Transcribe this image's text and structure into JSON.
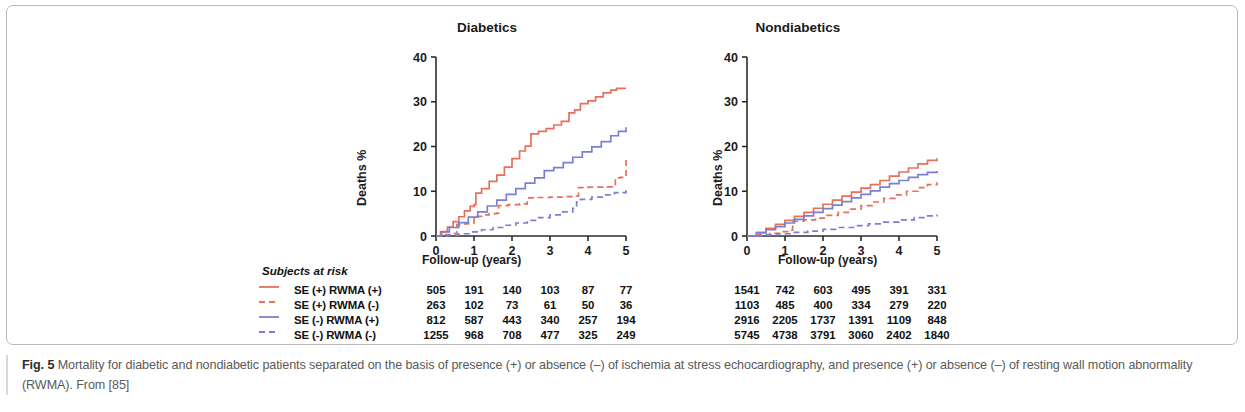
{
  "caption": {
    "label": "Fig. 5",
    "text": " Mortality for diabetic and nondiabetic patients separated on the basis of presence (+) or absence (–) of ischemia at stress echocardiography, and presence (+) or absence (–) of resting wall motion abnormality (RWMA). From [85]"
  },
  "colors": {
    "red": "#e8705a",
    "blue": "#7b7fd4",
    "axis": "#2b2b2b",
    "frame": "#b9b9b9"
  },
  "risk_table": {
    "header": "Subjects at risk",
    "row_labels": [
      "SE (+) RWMA (+)",
      "SE (+) RWMA (-)",
      "SE (-)  RWMA (+)",
      "SE (-)  RWMA (-)"
    ],
    "diabetics": [
      [
        "505",
        "191",
        "140",
        "103",
        "87",
        "77"
      ],
      [
        "263",
        "102",
        "73",
        "61",
        "50",
        "36"
      ],
      [
        "812",
        "587",
        "443",
        "340",
        "257",
        "194"
      ],
      [
        "1255",
        "968",
        "708",
        "477",
        "325",
        "249"
      ]
    ],
    "nondiabetics": [
      [
        "1541",
        "742",
        "603",
        "495",
        "391",
        "331"
      ],
      [
        "1103",
        "485",
        "400",
        "334",
        "279",
        "220"
      ],
      [
        "2916",
        "2205",
        "1737",
        "1391",
        "1109",
        "848"
      ],
      [
        "5745",
        "4738",
        "3791",
        "3060",
        "2402",
        "1840"
      ]
    ]
  },
  "chart_data": [
    {
      "type": "line",
      "title": "Diabetics",
      "xlabel": "Follow-up (years)",
      "ylabel": "Deaths %",
      "xlim": [
        0,
        5
      ],
      "ylim": [
        0,
        40
      ],
      "xticks": [
        0,
        1,
        2,
        3,
        4,
        5
      ],
      "yticks": [
        0,
        10,
        20,
        30,
        40
      ],
      "grid": false,
      "legend": "external",
      "series": [
        {
          "name": "SE (+) RWMA (+)",
          "color": "#e8705a",
          "style": "solid",
          "x": [
            0,
            0.12,
            0.3,
            0.45,
            0.6,
            0.75,
            0.9,
            1.0,
            1.05,
            1.2,
            1.4,
            1.6,
            1.8,
            2.0,
            2.2,
            2.35,
            2.5,
            2.7,
            2.9,
            3.1,
            3.3,
            3.5,
            3.65,
            3.8,
            4.0,
            4.2,
            4.4,
            4.6,
            4.75,
            5.0
          ],
          "y": [
            0,
            1.0,
            2.0,
            3.2,
            4.3,
            5.6,
            6.6,
            7.0,
            9.6,
            10.6,
            12.2,
            13.6,
            15.4,
            17.3,
            19.0,
            20.1,
            22.8,
            23.4,
            24.0,
            24.8,
            25.6,
            27.5,
            28.2,
            29.6,
            30.2,
            31.1,
            32.0,
            32.6,
            33.0,
            33.0
          ]
        },
        {
          "name": "SE (+) RWMA (-)",
          "color": "#e8705a",
          "style": "dashed",
          "x": [
            0,
            0.25,
            0.4,
            0.5,
            0.55,
            0.7,
            0.85,
            1.0,
            1.2,
            1.4,
            1.6,
            1.65,
            1.9,
            2.2,
            2.4,
            2.6,
            3.0,
            3.4,
            3.7,
            3.75,
            4.0,
            4.4,
            4.65,
            4.72,
            4.85,
            5.0
          ],
          "y": [
            0,
            0.3,
            0.5,
            0.6,
            2.6,
            2.7,
            2.8,
            4.4,
            4.7,
            5.0,
            5.1,
            6.8,
            7.0,
            7.2,
            8.5,
            8.6,
            8.7,
            8.8,
            8.9,
            10.8,
            10.9,
            11.0,
            11.1,
            13.0,
            13.1,
            17.4
          ]
        },
        {
          "name": "SE (-) RWMA (+)",
          "color": "#7b7fd4",
          "style": "solid",
          "x": [
            0,
            0.15,
            0.35,
            0.6,
            0.85,
            1.1,
            1.35,
            1.6,
            1.85,
            2.1,
            2.35,
            2.6,
            2.85,
            3.1,
            3.35,
            3.6,
            3.85,
            4.1,
            4.35,
            4.6,
            4.8,
            5.0
          ],
          "y": [
            0,
            0.9,
            1.9,
            3.0,
            4.2,
            5.4,
            6.7,
            8.0,
            9.3,
            10.6,
            11.8,
            13.0,
            14.6,
            15.3,
            16.4,
            17.6,
            18.8,
            19.9,
            21.1,
            22.4,
            23.4,
            24.3
          ]
        },
        {
          "name": "SE (-) RWMA (-)",
          "color": "#7b7fd4",
          "style": "dashed",
          "x": [
            0,
            0.3,
            0.6,
            0.9,
            1.2,
            1.5,
            1.8,
            2.1,
            2.4,
            2.7,
            3.0,
            3.3,
            3.6,
            3.7,
            3.8,
            4.1,
            4.4,
            4.7,
            5.0
          ],
          "y": [
            0,
            0.2,
            0.5,
            0.9,
            1.4,
            1.9,
            2.4,
            2.9,
            3.5,
            4.1,
            4.7,
            5.4,
            6.2,
            7.6,
            8.2,
            8.7,
            9.2,
            9.7,
            10.2
          ]
        }
      ]
    },
    {
      "type": "line",
      "title": "Nondiabetics",
      "xlabel": "Follow-up (years)",
      "ylabel": "Deaths %",
      "xlim": [
        0,
        5
      ],
      "ylim": [
        0,
        40
      ],
      "xticks": [
        0,
        1,
        2,
        3,
        4,
        5
      ],
      "yticks": [
        0,
        10,
        20,
        30,
        40
      ],
      "grid": false,
      "legend": "external",
      "series": [
        {
          "name": "SE (+) RWMA (+)",
          "color": "#e8705a",
          "style": "solid",
          "x": [
            0,
            0.25,
            0.5,
            0.75,
            1.0,
            1.25,
            1.5,
            1.75,
            2.0,
            2.25,
            2.5,
            2.75,
            3.0,
            3.25,
            3.5,
            3.75,
            4.0,
            4.25,
            4.5,
            4.75,
            5.0
          ],
          "y": [
            0,
            0.8,
            1.7,
            2.6,
            3.5,
            4.4,
            5.3,
            6.2,
            7.1,
            8.0,
            8.9,
            9.8,
            10.7,
            11.5,
            12.4,
            13.4,
            14.3,
            15.2,
            16.1,
            16.9,
            17.4
          ]
        },
        {
          "name": "SE (+) RWMA (-)",
          "color": "#e8705a",
          "style": "dashed",
          "x": [
            0,
            0.3,
            0.6,
            0.9,
            1.1,
            1.2,
            1.5,
            1.8,
            2.1,
            2.4,
            2.7,
            3.0,
            3.3,
            3.6,
            3.9,
            4.2,
            4.5,
            4.75,
            5.0
          ],
          "y": [
            0,
            0.3,
            0.6,
            1.0,
            1.3,
            3.3,
            3.6,
            4.0,
            4.6,
            5.3,
            6.0,
            6.8,
            7.6,
            8.4,
            9.2,
            10.0,
            10.8,
            11.5,
            12.0
          ]
        },
        {
          "name": "SE (-) RWMA (+)",
          "color": "#7b7fd4",
          "style": "solid",
          "x": [
            0,
            0.25,
            0.5,
            0.75,
            1.0,
            1.25,
            1.5,
            1.75,
            2.0,
            2.25,
            2.5,
            2.75,
            3.0,
            3.25,
            3.5,
            3.75,
            4.0,
            4.25,
            4.5,
            4.75,
            5.0
          ],
          "y": [
            0,
            0.7,
            1.4,
            2.1,
            2.9,
            3.7,
            4.5,
            5.3,
            6.1,
            6.9,
            7.7,
            8.5,
            9.3,
            10.1,
            10.9,
            11.7,
            12.4,
            13.1,
            13.7,
            14.2,
            14.5
          ]
        },
        {
          "name": "SE (-) RWMA (-)",
          "color": "#7b7fd4",
          "style": "dashed",
          "x": [
            0,
            0.4,
            0.8,
            1.2,
            1.6,
            2.0,
            2.4,
            2.8,
            3.2,
            3.6,
            4.0,
            4.4,
            4.7,
            5.0
          ],
          "y": [
            0,
            0.25,
            0.5,
            0.8,
            1.1,
            1.5,
            1.9,
            2.3,
            2.7,
            3.1,
            3.6,
            4.1,
            4.5,
            4.8
          ]
        }
      ]
    }
  ]
}
